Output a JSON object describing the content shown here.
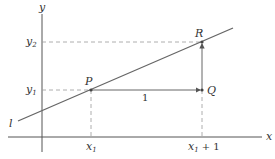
{
  "diagram": {
    "axes": {
      "x_label": "x",
      "y_label": "y"
    },
    "line_label": "l",
    "points": {
      "P": {
        "label": "P",
        "coords": "(x1, y1)"
      },
      "Q": {
        "label": "Q",
        "coords": "(x1 + 1, y1)"
      },
      "R": {
        "label": "R",
        "coords": "(x1 + 1, y2)"
      }
    },
    "tick_labels": {
      "x1": "x",
      "x1_sub": "1",
      "x1_plus_1": "x",
      "x1_plus_1_sub": "1",
      "x1_plus_1_tail": "+ 1",
      "y1": "y",
      "y1_sub": "1",
      "y2": "y",
      "y2_sub": "2"
    },
    "run_label": "1",
    "colors": {
      "axis": "#555555",
      "line": "#666666",
      "dashed": "#999999",
      "text": "#333333"
    }
  }
}
